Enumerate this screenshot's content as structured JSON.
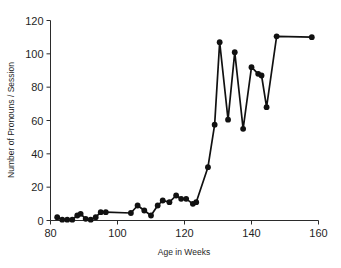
{
  "chart_data": {
    "type": "line",
    "title": "",
    "xlabel": "Age in Weeks",
    "ylabel": "Number of Pronouns / Session",
    "xlim": [
      80,
      160
    ],
    "ylim": [
      0,
      120
    ],
    "xticks": [
      80,
      100,
      120,
      140,
      160
    ],
    "yticks": [
      0,
      20,
      40,
      60,
      80,
      100,
      120
    ],
    "grid": false,
    "legend": null,
    "marker": "filled-circle",
    "line_color": "#111111",
    "marker_color": "#111111",
    "series": [
      {
        "name": "Pronouns per session",
        "x": [
          82,
          83.5,
          85,
          86.5,
          88,
          89,
          90.5,
          92,
          93.5,
          95,
          96.5,
          104,
          106,
          108,
          110,
          112,
          113.5,
          115.5,
          117.5,
          119,
          120.5,
          122.5,
          123.5,
          127,
          129,
          130.5,
          133,
          135,
          137.5,
          140,
          142,
          143,
          144.5,
          147.5,
          158
        ],
        "y": [
          2,
          0.5,
          0.5,
          0.5,
          3,
          4,
          1,
          0.5,
          2,
          5,
          5,
          4.5,
          9,
          6,
          3,
          9,
          12,
          11,
          15,
          13,
          13,
          10,
          11,
          32,
          57.5,
          107,
          60.5,
          101,
          55,
          92,
          88,
          87,
          68,
          110.5,
          110
        ]
      }
    ]
  },
  "axis": {
    "x_tick_labels": [
      "80",
      "100",
      "120",
      "140",
      "160"
    ],
    "y_tick_labels": [
      "0",
      "20",
      "40",
      "60",
      "80",
      "100",
      "120"
    ],
    "x_title": "Age in Weeks",
    "y_title": "Number of Pronouns / Session"
  }
}
